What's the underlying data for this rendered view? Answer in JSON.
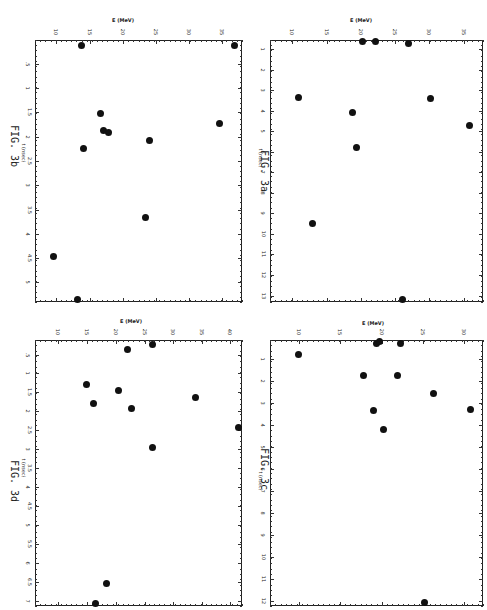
{
  "figure": {
    "orientation": "rotated 90 degrees clockwise",
    "panels": [
      {
        "id": "3b",
        "fig_label": "FIG. 3b",
        "x_label": "E (MeV)",
        "y_label": "t (nsec)"
      },
      {
        "id": "3a",
        "fig_label": "FIG. 3a",
        "x_label": "E (MeV)",
        "y_label": "t (nsec)"
      },
      {
        "id": "3d",
        "fig_label": "FIG. 3d",
        "x_label": "E (MeV)",
        "y_label": "t (nsec)"
      },
      {
        "id": "3c",
        "fig_label": "FIG. 3c",
        "x_label": "E (MeV)",
        "y_label": "t (nsec)"
      }
    ]
  },
  "chart_data": [
    {
      "type": "scatter",
      "title": "FIG. 3a",
      "xlabel": "E (MeV)",
      "ylabel": "t (nsec)",
      "x_ticks": [
        "10",
        "15",
        "20",
        "25",
        "30",
        "35"
      ],
      "y_ticks": [
        "1",
        "2",
        "3",
        "4",
        "5",
        "6",
        "7",
        "8",
        "9",
        "10",
        "11",
        "12",
        "13"
      ],
      "xlim": [
        9,
        36
      ],
      "ylim": [
        0,
        13
      ],
      "grid": false,
      "points": [
        {
          "E": 20.1,
          "t": 0.1
        },
        {
          "E": 22.0,
          "t": 0.1
        },
        {
          "E": 26.8,
          "t": 0.2
        },
        {
          "E": 10.8,
          "t": 2.7
        },
        {
          "E": 30.2,
          "t": 2.8
        },
        {
          "E": 18.6,
          "t": 3.5
        },
        {
          "E": 35.9,
          "t": 4.1
        },
        {
          "E": 19.3,
          "t": 5.1
        },
        {
          "E": 12.8,
          "t": 8.8
        },
        {
          "E": 25.9,
          "t": 13.0
        }
      ]
    },
    {
      "type": "scatter",
      "title": "FIG. 3b",
      "xlabel": "E (MeV)",
      "ylabel": "t (nsec)",
      "x_ticks": [
        "10",
        "15",
        "20",
        "25",
        "30",
        "35"
      ],
      "y_ticks": [
        ".5",
        "1",
        "1.5",
        "2",
        "2.5",
        "3",
        "3.5",
        "4",
        "4.5",
        "5"
      ],
      "xlim": [
        9,
        37
      ],
      "ylim": [
        0,
        5.3
      ],
      "grid": false,
      "points": [
        {
          "E": 13.8,
          "t": 0.1
        },
        {
          "E": 36.5,
          "t": 0.1
        },
        {
          "E": 16.6,
          "t": 1.5
        },
        {
          "E": 17.2,
          "t": 1.85
        },
        {
          "E": 17.8,
          "t": 1.9
        },
        {
          "E": 14.1,
          "t": 2.2
        },
        {
          "E": 23.9,
          "t": 2.05
        },
        {
          "E": 34.4,
          "t": 1.7
        },
        {
          "E": 23.3,
          "t": 3.65
        },
        {
          "E": 9.5,
          "t": 4.45
        },
        {
          "E": 13.0,
          "t": 5.3
        }
      ]
    },
    {
      "type": "scatter",
      "title": "FIG. 3c",
      "xlabel": "E (MeV)",
      "ylabel": "t (nsec)",
      "x_ticks": [
        "10",
        "15",
        "20",
        "25",
        "30"
      ],
      "y_ticks": [
        "1",
        "2",
        "3",
        "4",
        "5",
        "6",
        "7",
        "8",
        "9",
        "10",
        "11",
        "12"
      ],
      "xlim": [
        9,
        31
      ],
      "ylim": [
        0,
        12
      ],
      "grid": false,
      "points": [
        {
          "E": 19.5,
          "t": 0.1
        },
        {
          "E": 19.8,
          "t": 0.0
        },
        {
          "E": 22.4,
          "t": 0.1
        },
        {
          "E": 9.9,
          "t": 0.7
        },
        {
          "E": 17.7,
          "t": 1.7
        },
        {
          "E": 21.8,
          "t": 1.7
        },
        {
          "E": 26.3,
          "t": 2.5
        },
        {
          "E": 18.9,
          "t": 3.3
        },
        {
          "E": 30.5,
          "t": 3.3
        },
        {
          "E": 20.2,
          "t": 4.2
        },
        {
          "E": 25.1,
          "t": 12.0
        }
      ]
    },
    {
      "type": "scatter",
      "title": "FIG. 3d",
      "xlabel": "E (MeV)",
      "ylabel": "t (nsec)",
      "x_ticks": [
        "10",
        "15",
        "20",
        "25",
        "30",
        "35",
        "40"
      ],
      "y_ticks": [
        ".5",
        "1",
        "1.5",
        "2",
        "2.5",
        "3",
        "3.5",
        "4",
        "4.5",
        "5",
        "5.5",
        "6",
        "6.5",
        "7"
      ],
      "xlim": [
        9,
        41
      ],
      "ylim": [
        0,
        7
      ],
      "grid": false,
      "points": [
        {
          "E": 25.1,
          "t": 0.1
        },
        {
          "E": 23.5,
          "t": 0.3
        },
        {
          "E": 14.9,
          "t": 1.2
        },
        {
          "E": 20.1,
          "t": 1.4
        },
        {
          "E": 32.5,
          "t": 1.55
        },
        {
          "E": 16.2,
          "t": 1.7
        },
        {
          "E": 21.1,
          "t": 1.8
        },
        {
          "E": 41.0,
          "t": 2.35
        },
        {
          "E": 25.2,
          "t": 2.9
        },
        {
          "E": 18.3,
          "t": 6.5
        },
        {
          "E": 16.1,
          "t": 7.0
        }
      ]
    }
  ],
  "render": {
    "3b": {
      "box": [
        35,
        40,
        207,
        262
      ],
      "xticks": [
        {
          "v": "10",
          "x": 56
        },
        {
          "v": "15",
          "x": 90
        },
        {
          "v": "20",
          "x": 123
        },
        {
          "v": "25",
          "x": 156
        },
        {
          "v": "30",
          "x": 189
        },
        {
          "v": "35",
          "x": 222
        }
      ],
      "yticks": [
        {
          "v": ".5",
          "y": 64
        },
        {
          "v": "1",
          "y": 88
        },
        {
          "v": "1.5",
          "y": 112
        },
        {
          "v": "2",
          "y": 137
        },
        {
          "v": "2.5",
          "y": 161
        },
        {
          "v": "3",
          "y": 185
        },
        {
          "v": "3.5",
          "y": 210
        },
        {
          "v": "4",
          "y": 234
        },
        {
          "v": "4.5",
          "y": 258
        },
        {
          "v": "5",
          "y": 282
        }
      ],
      "dots": [
        [
          81,
          45
        ],
        [
          234,
          45
        ],
        [
          100,
          113
        ],
        [
          103,
          130
        ],
        [
          108,
          132
        ],
        [
          83,
          148
        ],
        [
          149,
          140
        ],
        [
          219,
          123
        ],
        [
          145,
          217
        ],
        [
          53,
          256
        ],
        [
          77,
          299
        ]
      ],
      "fig": [
        8,
        125
      ],
      "xlabel": [
        122,
        17
      ],
      "ylabel": [
        14,
        150
      ]
    },
    "3a": {
      "box": [
        270,
        40,
        213,
        262
      ],
      "xticks": [
        {
          "v": "10",
          "x": 292
        },
        {
          "v": "15",
          "x": 327
        },
        {
          "v": "20",
          "x": 361
        },
        {
          "v": "25",
          "x": 395
        },
        {
          "v": "30",
          "x": 429
        },
        {
          "v": "35",
          "x": 464
        }
      ],
      "yticks": [
        {
          "v": "1",
          "y": 49
        },
        {
          "v": "2",
          "y": 70
        },
        {
          "v": "3",
          "y": 90
        },
        {
          "v": "4",
          "y": 111
        },
        {
          "v": "5",
          "y": 131
        },
        {
          "v": "6",
          "y": 152
        },
        {
          "v": "7",
          "y": 172
        },
        {
          "v": "8",
          "y": 193
        },
        {
          "v": "9",
          "y": 213
        },
        {
          "v": "10",
          "y": 234
        },
        {
          "v": "11",
          "y": 254
        },
        {
          "v": "12",
          "y": 275
        },
        {
          "v": "13",
          "y": 296
        }
      ],
      "dots": [
        [
          362,
          41
        ],
        [
          375,
          41
        ],
        [
          408,
          43
        ],
        [
          298,
          97
        ],
        [
          430,
          98
        ],
        [
          352,
          112
        ],
        [
          469,
          125
        ],
        [
          356,
          147
        ],
        [
          312,
          223
        ],
        [
          402,
          299
        ]
      ],
      "fig": [
        258,
        150
      ],
      "xlabel": [
        360,
        17
      ],
      "ylabel": [
        251,
        155
      ]
    },
    "3d": {
      "box": [
        35,
        340,
        207,
        266
      ],
      "xticks": [
        {
          "v": "10",
          "x": 58
        },
        {
          "v": "15",
          "x": 87
        },
        {
          "v": "20",
          "x": 116
        },
        {
          "v": "25",
          "x": 145
        },
        {
          "v": "30",
          "x": 173
        },
        {
          "v": "35",
          "x": 202
        },
        {
          "v": "40",
          "x": 230
        }
      ],
      "yticks": [
        {
          "v": ".5",
          "y": 355
        },
        {
          "v": "1",
          "y": 373
        },
        {
          "v": "1.5",
          "y": 392
        },
        {
          "v": "2",
          "y": 411
        },
        {
          "v": "2.5",
          "y": 430
        },
        {
          "v": "3",
          "y": 449
        },
        {
          "v": "3.5",
          "y": 468
        },
        {
          "v": "4",
          "y": 487
        },
        {
          "v": "4.5",
          "y": 506
        },
        {
          "v": "5",
          "y": 525
        },
        {
          "v": "5.5",
          "y": 544
        },
        {
          "v": "6",
          "y": 563
        },
        {
          "v": "6.5",
          "y": 582
        },
        {
          "v": "7",
          "y": 601
        }
      ],
      "dots": [
        [
          152,
          344
        ],
        [
          127,
          349
        ],
        [
          86,
          384
        ],
        [
          118,
          390
        ],
        [
          195,
          397
        ],
        [
          93,
          403
        ],
        [
          131,
          408
        ],
        [
          238,
          427
        ],
        [
          152,
          447
        ],
        [
          106,
          583
        ],
        [
          95,
          603
        ]
      ],
      "fig": [
        8,
        460
      ],
      "xlabel": [
        130,
        318
      ],
      "ylabel": [
        14,
        465
      ]
    },
    "3c": {
      "box": [
        270,
        340,
        213,
        266
      ],
      "xticks": [
        {
          "v": "10",
          "x": 299
        },
        {
          "v": "15",
          "x": 340
        },
        {
          "v": "20",
          "x": 382
        },
        {
          "v": "25",
          "x": 423
        },
        {
          "v": "30",
          "x": 464
        }
      ],
      "yticks": [
        {
          "v": "1",
          "y": 359
        },
        {
          "v": "2",
          "y": 381
        },
        {
          "v": "3",
          "y": 403
        },
        {
          "v": "4",
          "y": 425
        },
        {
          "v": "5",
          "y": 447
        },
        {
          "v": "6",
          "y": 469
        },
        {
          "v": "7",
          "y": 491
        },
        {
          "v": "8",
          "y": 513
        },
        {
          "v": "9",
          "y": 535
        },
        {
          "v": "10",
          "y": 557
        },
        {
          "v": "11",
          "y": 579
        },
        {
          "v": "12",
          "y": 601
        }
      ],
      "dots": [
        [
          376,
          343
        ],
        [
          379,
          341
        ],
        [
          400,
          343
        ],
        [
          298,
          354
        ],
        [
          363,
          375
        ],
        [
          397,
          375
        ],
        [
          433,
          393
        ],
        [
          373,
          410
        ],
        [
          470,
          409
        ],
        [
          383,
          429
        ],
        [
          424,
          602
        ]
      ],
      "fig": [
        258,
        448
      ],
      "xlabel": [
        372,
        320
      ],
      "ylabel": [
        251,
        478
      ]
    }
  }
}
